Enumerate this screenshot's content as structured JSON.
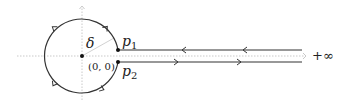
{
  "diagram": {
    "type": "keyhole-contour",
    "labels": {
      "delta": "δ",
      "p1_main": "p",
      "p1_sub": "1",
      "p2_main": "p",
      "p2_sub": "2",
      "origin": "(0, 0)",
      "infinity": "+∞"
    },
    "colors": {
      "contour": "#333333",
      "axis": "#bbbbbb",
      "radius": "#cccccc",
      "text": "#222222"
    },
    "geometry": {
      "center": [
        82,
        56
      ],
      "radius": 37,
      "p1": [
        118,
        50
      ],
      "p2": [
        118,
        62
      ],
      "line_end_x": 302
    }
  }
}
